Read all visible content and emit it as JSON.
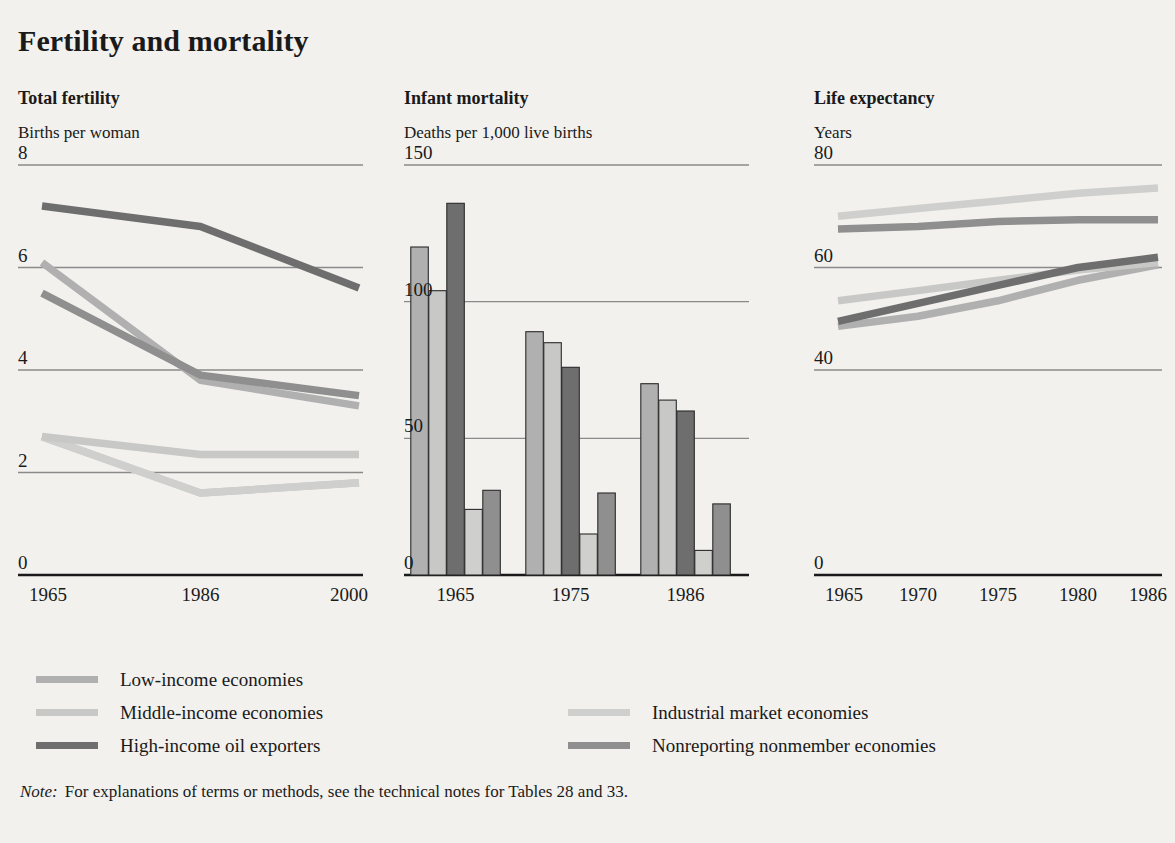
{
  "title": "Fertility and mortality",
  "note": {
    "label": "Note:",
    "text": "For explanations of terms or methods, see the technical notes for Tables 28 and 33."
  },
  "colors": {
    "low_income": "#b0b0b0",
    "middle_income": "#c8c8c6",
    "high_income_oil": "#6e6e6e",
    "industrial_market": "#cfcfcd",
    "nonreporting": "#8f8f8f",
    "gridline": "#8a8a8a",
    "axis": "#1a1a1a",
    "background": "#f2f1ee"
  },
  "legend": {
    "left_items": [
      {
        "label": "Low-income economies",
        "color_key": "low_income"
      },
      {
        "label": "Middle-income economies",
        "color_key": "middle_income"
      },
      {
        "label": "High-income oil exporters",
        "color_key": "high_income_oil"
      }
    ],
    "right_items": [
      {
        "label": "Industrial market economies",
        "color_key": "industrial_market"
      },
      {
        "label": "Nonreporting nonmember economies",
        "color_key": "nonreporting"
      }
    ]
  },
  "chart_data": [
    {
      "type": "line",
      "title": "Total fertility",
      "ylabel": "Births per woman",
      "xlabel": "",
      "x": [
        "1965",
        "1986",
        "2000"
      ],
      "x_values": [
        1965,
        1986,
        2000
      ],
      "ylim": [
        0,
        8
      ],
      "yticks": [
        0,
        2,
        4,
        6,
        8
      ],
      "gridlines": [
        2,
        4,
        6,
        8
      ],
      "grid": true,
      "legend_position": "below-figure",
      "series": [
        {
          "name": "Low-income economies",
          "color_key": "low_income",
          "values": [
            6.1,
            3.8,
            3.3
          ]
        },
        {
          "name": "Middle-income economies",
          "color_key": "middle_income",
          "values": [
            2.7,
            1.6,
            1.8
          ]
        },
        {
          "name": "High-income oil exporters",
          "color_key": "high_income_oil",
          "values": [
            7.2,
            6.8,
            5.6
          ]
        },
        {
          "name": "Industrial market economies",
          "color_key": "industrial_market",
          "values": [
            2.7,
            1.6,
            1.8
          ]
        },
        {
          "name": "Nonreporting nonmember economies",
          "color_key": "nonreporting",
          "values": [
            5.5,
            3.9,
            3.5
          ]
        },
        {
          "name": "Middle-income economies (upper)",
          "color_key": "middle_income",
          "values": [
            2.7,
            2.35,
            2.35
          ]
        }
      ]
    },
    {
      "type": "bar",
      "title": "Infant mortality",
      "ylabel": "Deaths per 1,000 live births",
      "xlabel": "",
      "categories": [
        "1965",
        "1975",
        "1986"
      ],
      "ylim": [
        0,
        150
      ],
      "yticks": [
        0,
        50,
        100,
        150
      ],
      "gridlines": [
        50,
        100,
        150
      ],
      "grid": true,
      "series": [
        {
          "name": "Low-income economies",
          "color_key": "low_income",
          "values": [
            120,
            89,
            70
          ]
        },
        {
          "name": "Middle-income economies",
          "color_key": "middle_income",
          "values": [
            104,
            85,
            64
          ]
        },
        {
          "name": "High-income oil exporters",
          "color_key": "high_income_oil",
          "values": [
            136,
            76,
            60
          ]
        },
        {
          "name": "Industrial market economies",
          "color_key": "industrial_market",
          "values": [
            24,
            15,
            9
          ]
        },
        {
          "name": "Nonreporting nonmember economies",
          "color_key": "nonreporting",
          "values": [
            31,
            30,
            26
          ]
        }
      ]
    },
    {
      "type": "line",
      "title": "Life expectancy",
      "ylabel": "Years",
      "xlabel": "",
      "x": [
        "1965",
        "1970",
        "1975",
        "1980",
        "1986"
      ],
      "x_values": [
        1965,
        1970,
        1975,
        1980,
        1986
      ],
      "ylim": [
        0,
        80
      ],
      "yticks": [
        0,
        40,
        60,
        80
      ],
      "gridlines": [
        40,
        60,
        80
      ],
      "grid": true,
      "series": [
        {
          "name": "Low-income economies",
          "color_key": "low_income",
          "values": [
            48.5,
            50.5,
            53.5,
            57.5,
            60.5
          ]
        },
        {
          "name": "Middle-income economies",
          "color_key": "middle_income",
          "values": [
            53.5,
            55.5,
            57.5,
            59.5,
            61.0
          ]
        },
        {
          "name": "High-income oil exporters",
          "color_key": "high_income_oil",
          "values": [
            49.5,
            53.0,
            56.5,
            60.0,
            62.0
          ]
        },
        {
          "name": "Industrial market economies",
          "color_key": "industrial_market",
          "values": [
            70.0,
            71.5,
            73.0,
            74.5,
            75.5
          ]
        },
        {
          "name": "Nonreporting nonmember economies",
          "color_key": "nonreporting",
          "values": [
            67.5,
            68.0,
            69.0,
            69.3,
            69.3
          ]
        }
      ]
    }
  ]
}
